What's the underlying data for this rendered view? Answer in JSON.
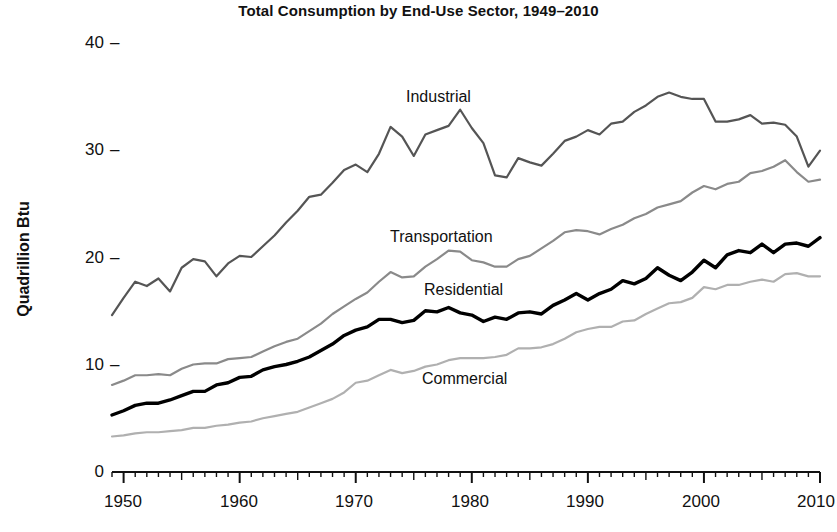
{
  "chart_data": {
    "type": "line",
    "title": "Total Consumption by End-Use Sector, 1949–2010",
    "xlabel": "",
    "ylabel": "Quadrillion Btu",
    "xlim": [
      1949,
      2010
    ],
    "ylim": [
      0,
      40
    ],
    "grid": false,
    "legend_position": "inline-labels",
    "y_ticks": [
      0,
      10,
      20,
      30,
      40
    ],
    "y_tick_labels": [
      "0",
      "10",
      "20",
      "30",
      "40"
    ],
    "x_ticks": [
      1950,
      1960,
      1970,
      1980,
      1990,
      2000,
      2010
    ],
    "x_tick_labels": [
      "1950",
      "1960",
      "1970",
      "1980",
      "1990",
      "2000",
      "2010"
    ],
    "x_minor_tick_interval": 1,
    "x": [
      1949,
      1950,
      1951,
      1952,
      1953,
      1954,
      1955,
      1956,
      1957,
      1958,
      1959,
      1960,
      1961,
      1962,
      1963,
      1964,
      1965,
      1966,
      1967,
      1968,
      1969,
      1970,
      1971,
      1972,
      1973,
      1974,
      1975,
      1976,
      1977,
      1978,
      1979,
      1980,
      1981,
      1982,
      1983,
      1984,
      1985,
      1986,
      1987,
      1988,
      1989,
      1990,
      1991,
      1992,
      1993,
      1994,
      1995,
      1996,
      1997,
      1998,
      1999,
      2000,
      2001,
      2002,
      2003,
      2004,
      2005,
      2006,
      2007,
      2008,
      2009,
      2010
    ],
    "series": [
      {
        "name": "Industrial",
        "color": "#555555",
        "line_width": 2.2,
        "label_x": 1975,
        "label_y": 36.2,
        "values": [
          14.6,
          16.2,
          17.7,
          17.3,
          18.0,
          16.8,
          19.0,
          19.8,
          19.6,
          18.2,
          19.4,
          20.1,
          20.0,
          21.0,
          22.0,
          23.2,
          24.3,
          25.6,
          25.8,
          26.9,
          28.1,
          28.6,
          27.9,
          29.6,
          32.1,
          31.2,
          29.4,
          31.4,
          31.8,
          32.2,
          33.7,
          32.0,
          30.6,
          27.6,
          27.4,
          29.2,
          28.8,
          28.5,
          29.6,
          30.8,
          31.2,
          31.8,
          31.4,
          32.4,
          32.6,
          33.5,
          34.1,
          34.9,
          35.3,
          34.9,
          34.7,
          34.7,
          32.6,
          32.6,
          32.8,
          33.2,
          32.4,
          32.5,
          32.3,
          31.2,
          28.4,
          29.9
        ]
      },
      {
        "name": "Transportation",
        "color": "#8a8a8a",
        "line_width": 2.2,
        "label_x": 1971,
        "label_y": 21.8,
        "values": [
          8.1,
          8.5,
          9.0,
          9.0,
          9.1,
          9.0,
          9.6,
          10.0,
          10.1,
          10.1,
          10.5,
          10.6,
          10.7,
          11.2,
          11.7,
          12.1,
          12.4,
          13.1,
          13.8,
          14.7,
          15.4,
          16.1,
          16.7,
          17.7,
          18.6,
          18.1,
          18.2,
          19.1,
          19.8,
          20.6,
          20.5,
          19.7,
          19.5,
          19.1,
          19.1,
          19.8,
          20.1,
          20.8,
          21.5,
          22.3,
          22.5,
          22.4,
          22.1,
          22.6,
          23.0,
          23.6,
          24.0,
          24.6,
          24.9,
          25.2,
          26.0,
          26.6,
          26.3,
          26.8,
          27.0,
          27.8,
          28.0,
          28.4,
          29.0,
          27.9,
          27.0,
          27.2
        ]
      },
      {
        "name": "Residential",
        "color": "#000000",
        "line_width": 3.4,
        "label_x": 1971,
        "label_y": 18.0,
        "values": [
          5.3,
          5.7,
          6.2,
          6.4,
          6.4,
          6.7,
          7.1,
          7.5,
          7.5,
          8.1,
          8.3,
          8.8,
          8.9,
          9.5,
          9.8,
          10.0,
          10.3,
          10.7,
          11.3,
          11.9,
          12.7,
          13.2,
          13.5,
          14.2,
          14.2,
          13.9,
          14.1,
          15.0,
          14.9,
          15.3,
          14.8,
          14.6,
          14.0,
          14.4,
          14.2,
          14.8,
          14.9,
          14.7,
          15.5,
          16.0,
          16.6,
          16.0,
          16.6,
          17.0,
          17.8,
          17.5,
          18.0,
          19.0,
          18.3,
          17.8,
          18.6,
          19.7,
          19.0,
          20.2,
          20.6,
          20.4,
          21.2,
          20.4,
          21.2,
          21.3,
          21.0,
          21.8
        ]
      },
      {
        "name": "Commercial",
        "color": "#b0b0b0",
        "line_width": 2.2,
        "label_x": 1983,
        "label_y": 9.0,
        "values": [
          3.3,
          3.4,
          3.6,
          3.7,
          3.7,
          3.8,
          3.9,
          4.1,
          4.1,
          4.3,
          4.4,
          4.6,
          4.7,
          5.0,
          5.2,
          5.4,
          5.6,
          6.0,
          6.4,
          6.8,
          7.4,
          8.3,
          8.5,
          9.0,
          9.5,
          9.2,
          9.4,
          9.8,
          10.0,
          10.4,
          10.6,
          10.6,
          10.6,
          10.7,
          10.9,
          11.5,
          11.5,
          11.6,
          11.9,
          12.4,
          13.0,
          13.3,
          13.5,
          13.5,
          14.0,
          14.1,
          14.7,
          15.2,
          15.7,
          15.8,
          16.2,
          17.2,
          17.0,
          17.4,
          17.4,
          17.7,
          17.9,
          17.7,
          18.4,
          18.5,
          18.2,
          18.2
        ]
      }
    ]
  },
  "axes": {
    "y_label": "Quadrillion Btu",
    "y_ticks": [
      "40",
      "30",
      "20",
      "10",
      "0"
    ],
    "tick_dash": "–",
    "x_ticks": [
      "1950",
      "1960",
      "1970",
      "1980",
      "1990",
      "2000",
      "2010"
    ]
  },
  "title": "Total Consumption by End-Use Sector, 1949–2010",
  "series_labels": {
    "industrial": "Industrial",
    "transportation": "Transportation",
    "residential": "Residential",
    "commercial": "Commercial"
  }
}
